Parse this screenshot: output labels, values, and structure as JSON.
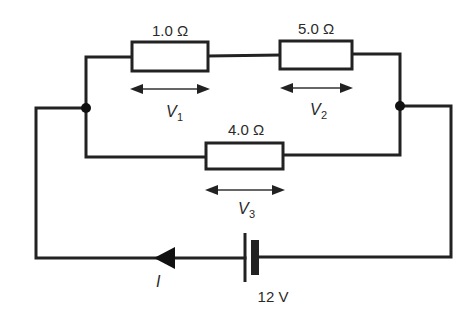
{
  "diagram": {
    "type": "circuit",
    "resistors": [
      {
        "id": "R1",
        "label": "1.0 Ω",
        "voltage_symbol": "V",
        "voltage_subscript": "1"
      },
      {
        "id": "R2",
        "label": "5.0 Ω",
        "voltage_symbol": "V",
        "voltage_subscript": "2"
      },
      {
        "id": "R3",
        "label": "4.0 Ω",
        "voltage_symbol": "V",
        "voltage_subscript": "3"
      }
    ],
    "battery": {
      "label": "12 V"
    },
    "current": {
      "symbol": "I"
    },
    "colors": {
      "line": "#222222",
      "background": "#ffffff"
    }
  }
}
